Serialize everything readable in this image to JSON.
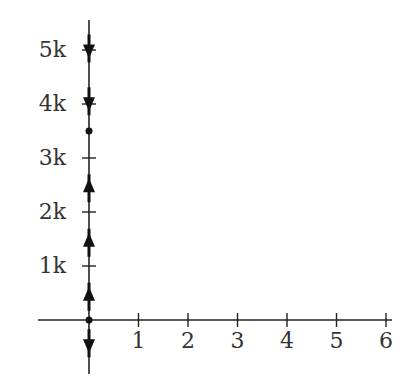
{
  "chart_data": {
    "type": "line",
    "title": "",
    "xlabel": "",
    "ylabel": "",
    "xlim": [
      0,
      6
    ],
    "ylim": [
      -1000,
      5500
    ],
    "grid": false,
    "legend": null,
    "x_ticks": [
      1,
      2,
      3,
      4,
      5,
      6
    ],
    "x_tick_labels": [
      "1",
      "2",
      "3",
      "4",
      "5",
      "6"
    ],
    "y_ticks": [
      1000,
      2000,
      3000,
      4000,
      5000
    ],
    "y_tick_labels": [
      "1k",
      "2k",
      "3k",
      "4k",
      "5k"
    ],
    "series": [
      {
        "name": "phase-line",
        "x": [
          0
        ],
        "equilibria": [
          {
            "y": 0,
            "marker": "dot"
          },
          {
            "y": 3500,
            "marker": "dot"
          }
        ],
        "arrows": [
          {
            "y": -430,
            "direction": "down"
          },
          {
            "y": 430,
            "direction": "up"
          },
          {
            "y": 1430,
            "direction": "up"
          },
          {
            "y": 2440,
            "direction": "up"
          },
          {
            "y": 4050,
            "direction": "down"
          },
          {
            "y": 5030,
            "direction": "down"
          }
        ]
      }
    ],
    "colors": {
      "axis": "#222222",
      "marker": "#111111",
      "text": "#333333"
    }
  }
}
